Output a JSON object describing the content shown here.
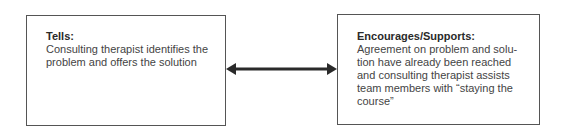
{
  "diagram": {
    "left_box": {
      "title": "Tells:",
      "text": "Consulting therapist identifies the problem and offers the solution"
    },
    "right_box": {
      "title": "Encourages/Supports:",
      "text": "Agreement on problem and solu-tion have already been reached and consulting therapist assists team members with “staying the course”"
    },
    "connector": {
      "type": "double-headed-arrow",
      "color": "#2a2a2a"
    }
  }
}
